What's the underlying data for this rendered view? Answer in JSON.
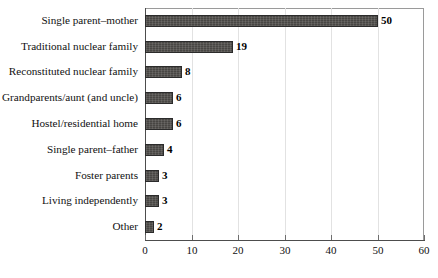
{
  "chart_data": {
    "type": "bar",
    "orientation": "horizontal",
    "title": "",
    "subtitle": "",
    "xlabel": "",
    "ylabel": "",
    "xlim": [
      0,
      60
    ],
    "xticks": [
      0,
      10,
      20,
      30,
      40,
      50,
      60
    ],
    "xtick_labels": [
      "0",
      "10",
      "20",
      "30",
      "40",
      "50",
      "60"
    ],
    "grid": true,
    "grid_axis": "x",
    "legend": false,
    "legend_position": "none",
    "data_labels": true,
    "categories": [
      "Single parent–mother",
      "Traditional nuclear family",
      "Reconstituted nuclear family",
      "Grandparents/aunt (and uncle)",
      "Hostel/residential home",
      "Single parent–father",
      "Foster parents",
      "Living independently",
      "Other"
    ],
    "values": [
      50,
      19,
      8,
      6,
      6,
      4,
      3,
      3,
      2
    ],
    "value_labels": [
      "50",
      "19",
      "8",
      "6",
      "6",
      "4",
      "3",
      "3",
      "2"
    ],
    "colors": {
      "bar_fill": "#4c4a47",
      "bar_border": "#2b2b2b",
      "axis": "#4d4d4d",
      "gridline": "#e2e2e2",
      "plot_border": "#9a9a9a",
      "text": "#111111",
      "background": "#ffffff"
    }
  }
}
